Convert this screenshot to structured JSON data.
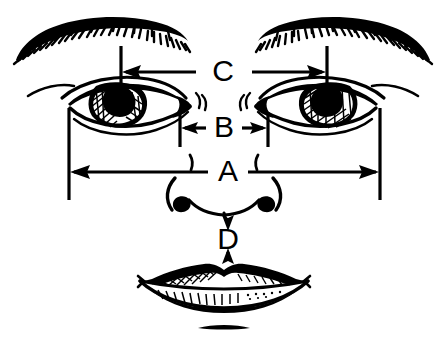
{
  "figure": {
    "background_color": "#ffffff",
    "ink_color": "#000000",
    "width": 446,
    "height": 344
  },
  "labels": {
    "a": "A",
    "b": "B",
    "c": "C",
    "d": "D"
  },
  "measurements": [
    {
      "key": "c",
      "label": "C",
      "name": "interpupillary-distance",
      "orientation": "horizontal",
      "arrow_style": "double-outward",
      "label_x": 223,
      "label_y": 72,
      "from_x": 121,
      "to_x": 327,
      "line_y": 72
    },
    {
      "key": "b",
      "label": "B",
      "name": "inner-canthal-distance",
      "orientation": "horizontal",
      "arrow_style": "double-outward",
      "label_x": 223,
      "label_y": 128,
      "from_x": 180,
      "to_x": 268,
      "line_y": 128
    },
    {
      "key": "a",
      "label": "A",
      "name": "outer-canthal-distance",
      "orientation": "horizontal",
      "arrow_style": "double-outward",
      "label_x": 228,
      "label_y": 172,
      "from_x": 69,
      "to_x": 380,
      "line_y": 172
    },
    {
      "key": "d",
      "label": "D",
      "name": "nose-base-to-upper-lip-distance",
      "orientation": "vertical",
      "arrow_style": "double-outward",
      "label_x": 228,
      "label_y": 238,
      "from_y": 214,
      "to_y": 262,
      "line_x": 228
    }
  ],
  "features": [
    {
      "name": "left-eyebrow",
      "label": "Left eyebrow"
    },
    {
      "name": "right-eyebrow",
      "label": "Right eyebrow"
    },
    {
      "name": "left-eye",
      "label": "Left eye"
    },
    {
      "name": "right-eye",
      "label": "Right eye"
    },
    {
      "name": "nose",
      "label": "Nose"
    },
    {
      "name": "lips",
      "label": "Lips"
    },
    {
      "name": "chin-crease",
      "label": "Chin crease"
    }
  ]
}
